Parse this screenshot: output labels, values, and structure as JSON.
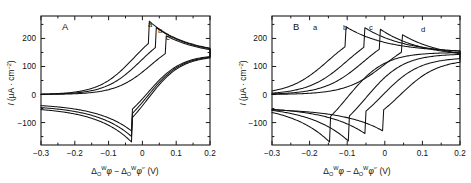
{
  "figure": {
    "panels": [
      {
        "id": "A",
        "letter": "A",
        "curve_labels": [
          "a",
          "b",
          "c"
        ]
      },
      {
        "id": "B",
        "letter": "B",
        "curve_labels": [
          "a",
          "b",
          "c",
          "d"
        ]
      }
    ],
    "axis": {
      "y_title_parts": {
        "symbol": "I",
        "unit_open": " (µA · cm",
        "unit_exp": "−2",
        "unit_close": ")"
      },
      "x_title_parts": {
        "delta1": "Δ",
        "sub1": "O",
        "sup1": "W",
        "phi1": "φ",
        "minus": " − ",
        "delta2": "Δ",
        "sub2": "O",
        "sup2": "W",
        "phi2": "φ",
        "prime": "°′",
        "unit": " (V)"
      }
    }
  },
  "chart_data": [
    {
      "type": "line",
      "title": "A",
      "xlabel": "Δ(O,W)φ − Δ(O,W)φ°′ (V)",
      "ylabel": "I (µA · cm−2)",
      "xlim": [
        -0.3,
        0.2
      ],
      "ylim": [
        -180,
        280
      ],
      "xticks": [
        -0.3,
        -0.2,
        -0.1,
        0,
        0.1,
        0.2
      ],
      "xticklabels": [
        "-0.3",
        "-0.2",
        "-0.1",
        "0",
        "0.1",
        "0.2"
      ],
      "yticks": [
        -100,
        0,
        100,
        200
      ],
      "yticklabels": [
        "-100",
        "0",
        "100",
        "200"
      ],
      "minor_xticks": [
        -0.25,
        -0.15,
        -0.05,
        0.05,
        0.15
      ],
      "minor_yticks": [
        -150,
        -50,
        50,
        150,
        250
      ],
      "grid": false,
      "legend": "inline curve letters a, b, c",
      "series": [
        {
          "name": "a",
          "forward_peak_x": 0.02,
          "forward_peak_y": 262,
          "reverse_peak_x": -0.03,
          "reverse_peak_y": -132,
          "start_y": 0,
          "end_y": 142
        },
        {
          "name": "b",
          "forward_peak_x": 0.04,
          "forward_peak_y": 240,
          "reverse_peak_x": -0.03,
          "reverse_peak_y": -152,
          "start_y": 0,
          "end_y": 140
        },
        {
          "name": "c",
          "forward_peak_x": 0.07,
          "forward_peak_y": 210,
          "reverse_peak_x": -0.03,
          "reverse_peak_y": -172,
          "start_y": 0,
          "end_y": 138
        }
      ]
    },
    {
      "type": "line",
      "title": "B",
      "xlabel": "Δ(O,W)φ − Δ(O,W)φ°′ (V)",
      "ylabel": "I (µA · cm−2)",
      "xlim": [
        -0.3,
        0.2
      ],
      "ylim": [
        -180,
        280
      ],
      "xticks": [
        -0.3,
        -0.2,
        -0.1,
        0,
        0.1,
        0.2
      ],
      "xticklabels": [
        "-0.3",
        "-0.2",
        "-0.1",
        "0",
        "0.1",
        "0.2"
      ],
      "yticks": [
        -100,
        0,
        100,
        200
      ],
      "yticklabels": [
        "-100",
        "0",
        "100",
        "200"
      ],
      "minor_xticks": [
        -0.25,
        -0.15,
        -0.05,
        0.05,
        0.15
      ],
      "minor_yticks": [
        -150,
        -50,
        50,
        150,
        250
      ],
      "grid": false,
      "legend": "inline curve letters a, b, c, d",
      "series": [
        {
          "name": "a",
          "forward_peak_x": -0.105,
          "forward_peak_y": 243,
          "reverse_peak_x": -0.145,
          "reverse_peak_y": -172,
          "start_y": 0,
          "end_y": 150
        },
        {
          "name": "b",
          "forward_peak_x": -0.055,
          "forward_peak_y": 240,
          "reverse_peak_x": -0.095,
          "reverse_peak_y": -168,
          "start_y": 0,
          "end_y": 145
        },
        {
          "name": "c",
          "forward_peak_x": -0.012,
          "forward_peak_y": 233,
          "reverse_peak_x": -0.052,
          "reverse_peak_y": -140,
          "start_y": 0,
          "end_y": 132
        },
        {
          "name": "d",
          "forward_peak_x": 0.045,
          "forward_peak_y": 215,
          "reverse_peak_x": -0.005,
          "reverse_peak_y": -130,
          "start_y": 0,
          "end_y": 125
        }
      ]
    }
  ]
}
